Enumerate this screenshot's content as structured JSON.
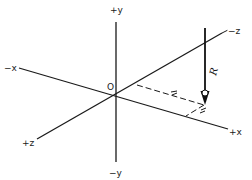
{
  "diagram": {
    "type": "3d-coordinate-axes-with-force",
    "origin_label": "O",
    "axes": {
      "pos_y": "+y",
      "neg_y": "−y",
      "neg_x": "−x",
      "pos_x": "+x",
      "neg_z": "−z",
      "pos_z": "+z"
    },
    "force": {
      "label": "R",
      "direction": "down (−y)"
    },
    "dimensions": {
      "along_z": "x̄",
      "along_x": "z̄"
    },
    "colors": {
      "line": "#1a1a1a",
      "background": "#ffffff"
    }
  }
}
